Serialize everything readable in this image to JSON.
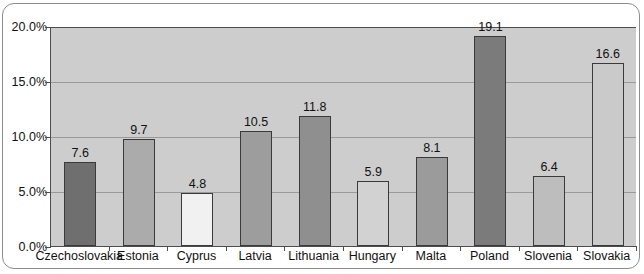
{
  "chart_data": {
    "type": "bar",
    "title": "",
    "xlabel": "",
    "ylabel": "",
    "ylim": [
      0,
      20
    ],
    "grid": true,
    "legend": "none",
    "y_tick_labels": [
      "20.0%",
      "15.0%",
      "10.0%",
      "5.0%",
      "0.0%"
    ],
    "y_tick_values": [
      20,
      15,
      10,
      5,
      0
    ],
    "categories": [
      "Czechoslovakia",
      "Estonia",
      "Cyprus",
      "Latvia",
      "Lithuania",
      "Hungary",
      "Malta",
      "Poland",
      "Slovenia",
      "Slovakia"
    ],
    "values": [
      7.6,
      9.7,
      4.8,
      10.5,
      11.8,
      5.9,
      8.1,
      19.1,
      6.4,
      16.6
    ],
    "value_labels": [
      "7.6",
      "9.7",
      "4.8",
      "10.5",
      "11.8",
      "5.9",
      "8.1",
      "19.1",
      "6.4",
      "16.6"
    ],
    "bar_colors": [
      "#6f6f6f",
      "#ababab",
      "#f1f1f1",
      "#9d9d9d",
      "#8f8f8f",
      "#d2d2d2",
      "#9b9b9b",
      "#7b7b7b",
      "#bdbdbd",
      "#cacaca"
    ],
    "bar_border_color": "#3a3a3a",
    "plot_background": "#cdcdcd",
    "gridline_color": "#9a9a9a",
    "axis_color": "#4d4d4d",
    "frame_border_color": "#8c8c8c",
    "text_color": "#111111"
  }
}
